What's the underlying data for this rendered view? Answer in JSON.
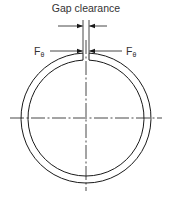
{
  "diagram": {
    "title": "Gap clearance",
    "force_label_left": {
      "symbol": "F",
      "subscript": "θ"
    },
    "force_label_right": {
      "symbol": "F",
      "subscript": "θ"
    },
    "colors": {
      "line": "#1a1a1a",
      "text": "#333333",
      "background": "#ffffff"
    }
  }
}
